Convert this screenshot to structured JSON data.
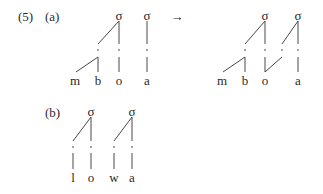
{
  "example_number": "(5)",
  "part_a": {
    "label": "(a)",
    "arrow": "→",
    "input": {
      "syllables": [
        "σ",
        "σ"
      ],
      "segments": [
        "m",
        "b",
        "o",
        "a"
      ]
    },
    "output": {
      "syllables": [
        "σ",
        "σ"
      ],
      "segments": [
        "m",
        "b",
        "o",
        "a"
      ]
    }
  },
  "part_b": {
    "label": "(b)",
    "syllables": [
      "σ",
      "σ"
    ],
    "segments": [
      "l",
      "o",
      "w",
      "a"
    ]
  }
}
